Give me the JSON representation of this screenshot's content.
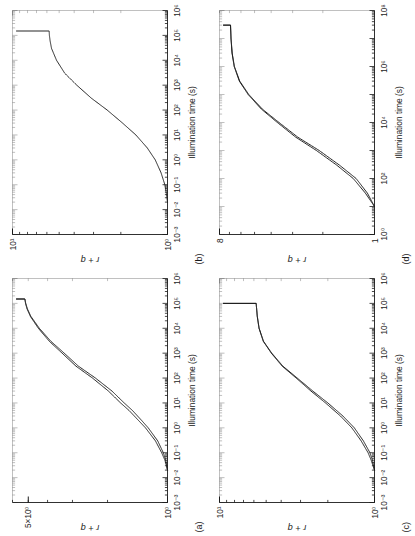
{
  "figure": {
    "orientation": "rotated-90-ccw",
    "background": "#ffffff",
    "line_color": "#1a1a1a",
    "panel_count": 4
  },
  "panels": [
    {
      "tag": "(a)",
      "name": "panel-a",
      "xlabel": "Illumination time (s)",
      "ylabel": "r + q",
      "xticks": [
        "10^-3",
        "10^-2",
        "10^-1",
        "10^0",
        "10^1",
        "10^2",
        "10^3",
        "10^4",
        "10^5",
        "10^6"
      ],
      "yticks": [
        "10^0",
        "5×10^0"
      ]
    },
    {
      "tag": "(b)",
      "name": "panel-b",
      "xlabel": "Illumination time (s)",
      "ylabel": "r + q",
      "xticks": [
        "10^-3",
        "10^-2",
        "10^-1",
        "10^0",
        "10^1",
        "10^2",
        "10^3",
        "10^4",
        "10^5",
        "10^6"
      ],
      "yticks": [
        "10^0",
        "10^1"
      ]
    },
    {
      "tag": "(c)",
      "name": "panel-c",
      "xlabel": "Illumination time (s)",
      "ylabel": "r + q",
      "xticks": [
        "10^-3",
        "10^-2",
        "10^-1",
        "10^0",
        "10^1",
        "10^2",
        "10^3",
        "10^4",
        "10^5",
        "10^6"
      ],
      "yticks": [
        "10^0",
        "10^1"
      ]
    },
    {
      "tag": "(d)",
      "name": "panel-d",
      "xlabel": "Illumination time (s)",
      "ylabel": "r + q",
      "xticks": [
        "10^0",
        "10^2",
        "10^4",
        "10^6",
        "10^8"
      ],
      "yticks": [
        "1",
        "8"
      ]
    }
  ],
  "chart_data": [
    {
      "type": "line",
      "panel": "(a)",
      "title": "",
      "xlabel": "Illumination time (s)",
      "ylabel": "r + q",
      "xscale": "log",
      "yscale": "log",
      "xlim": [
        0.001,
        1000000
      ],
      "ylim": [
        1.0,
        6.0
      ],
      "xtick_labels": [
        "10⁻³",
        "10⁻²",
        "10⁻¹",
        "10⁰",
        "10¹",
        "10²",
        "10³",
        "10⁴",
        "10⁵",
        "10⁶"
      ],
      "xtick_values": [
        0.001,
        0.01,
        0.1,
        1,
        10,
        100,
        1000,
        10000,
        100000,
        1000000
      ],
      "ytick_labels": [
        "10⁰",
        "5×10⁰"
      ],
      "ytick_values": [
        1,
        5
      ],
      "grid": false,
      "legend": false,
      "series": [
        {
          "name": "trace-1",
          "x": [
            0.02,
            0.05,
            0.1,
            0.3,
            1,
            2,
            5,
            10,
            30,
            100,
            300,
            1000,
            3000,
            10000,
            30000,
            60000,
            100000,
            150000
          ],
          "y": [
            1.0,
            1.02,
            1.05,
            1.12,
            1.25,
            1.35,
            1.5,
            1.65,
            1.9,
            2.3,
            2.8,
            3.3,
            3.85,
            4.4,
            4.85,
            5.05,
            5.15,
            5.2
          ]
        },
        {
          "name": "trace-2",
          "x": [
            0.02,
            0.05,
            0.1,
            0.3,
            1,
            2,
            5,
            10,
            30,
            100,
            300,
            1000,
            3000,
            10000,
            30000,
            60000,
            100000,
            150000
          ],
          "y": [
            1.0,
            1.03,
            1.07,
            1.15,
            1.29,
            1.4,
            1.56,
            1.72,
            1.98,
            2.38,
            2.88,
            3.38,
            3.92,
            4.45,
            4.88,
            5.07,
            5.16,
            5.2
          ]
        }
      ]
    },
    {
      "type": "line",
      "panel": "(b)",
      "title": "",
      "xlabel": "Illumination time (s)",
      "ylabel": "r + q",
      "xscale": "log",
      "yscale": "log",
      "xlim": [
        0.001,
        1000000
      ],
      "ylim": [
        1.0,
        10.0
      ],
      "xtick_labels": [
        "10⁻³",
        "10⁻²",
        "10⁻¹",
        "10⁰",
        "10¹",
        "10²",
        "10³",
        "10⁴",
        "10⁵",
        "10⁶"
      ],
      "xtick_values": [
        0.001,
        0.01,
        0.1,
        1,
        10,
        100,
        1000,
        10000,
        100000,
        1000000
      ],
      "ytick_labels": [
        "10⁰",
        "10¹"
      ],
      "ytick_values": [
        1,
        10
      ],
      "grid": false,
      "legend": false,
      "series": [
        {
          "name": "trace-1",
          "x": [
            0.02,
            0.05,
            0.1,
            0.3,
            1,
            3,
            10,
            30,
            100,
            300,
            1000,
            3000,
            10000,
            30000,
            60000,
            100000,
            150000
          ],
          "y": [
            1.0,
            1.02,
            1.04,
            1.1,
            1.2,
            1.35,
            1.6,
            1.95,
            2.45,
            3.1,
            3.85,
            4.6,
            5.2,
            5.6,
            5.72,
            5.78,
            5.8
          ]
        }
      ]
    },
    {
      "type": "line",
      "panel": "(c)",
      "title": "",
      "xlabel": "Illumination time (s)",
      "ylabel": "r + q",
      "xscale": "log",
      "yscale": "log",
      "xlim": [
        0.001,
        1000000
      ],
      "ylim": [
        1.0,
        10.0
      ],
      "xtick_labels": [
        "10⁻³",
        "10⁻²",
        "10⁻¹",
        "10⁰",
        "10¹",
        "10²",
        "10³",
        "10⁴",
        "10⁵",
        "10⁶"
      ],
      "xtick_values": [
        0.001,
        0.01,
        0.1,
        1,
        10,
        100,
        1000,
        10000,
        100000,
        1000000
      ],
      "ytick_labels": [
        "10⁰",
        "10¹"
      ],
      "ytick_values": [
        1,
        10
      ],
      "grid": false,
      "legend": false,
      "series": [
        {
          "name": "trace-1",
          "x": [
            0.02,
            0.05,
            0.1,
            0.3,
            1,
            3,
            10,
            30,
            100,
            300,
            1000,
            3000,
            10000,
            30000,
            60000,
            100000
          ],
          "y": [
            1.0,
            1.03,
            1.07,
            1.18,
            1.35,
            1.6,
            2.0,
            2.5,
            3.15,
            3.9,
            4.6,
            5.2,
            5.55,
            5.7,
            5.76,
            5.8
          ]
        },
        {
          "name": "trace-2",
          "x": [
            0.02,
            0.05,
            0.1,
            0.3,
            1,
            3,
            10,
            30,
            100,
            300,
            1000,
            3000,
            10000,
            30000,
            60000,
            100000
          ],
          "y": [
            1.0,
            1.05,
            1.1,
            1.22,
            1.4,
            1.66,
            2.07,
            2.57,
            3.2,
            3.94,
            4.63,
            5.22,
            5.56,
            5.71,
            5.76,
            5.8
          ]
        }
      ]
    },
    {
      "type": "line",
      "panel": "(d)",
      "title": "",
      "xlabel": "Illumination time (s)",
      "ylabel": "r + q",
      "xscale": "log",
      "yscale": "log",
      "xlim": [
        1,
        100000000
      ],
      "ylim": [
        1,
        8
      ],
      "xtick_labels": [
        "10⁰",
        "10²",
        "10⁴",
        "10⁶",
        "10⁸"
      ],
      "xtick_values": [
        1,
        100,
        10000,
        1000000,
        100000000
      ],
      "ytick_labels": [
        "1",
        "8"
      ],
      "ytick_values": [
        1,
        8
      ],
      "grid": false,
      "legend": false,
      "series": [
        {
          "name": "trace-1",
          "x": [
            10,
            30,
            100,
            300,
            1000,
            3000,
            10000,
            30000,
            100000,
            300000,
            1000000,
            3000000,
            10000000,
            30000000
          ],
          "y": [
            1.0,
            1.1,
            1.28,
            1.6,
            2.1,
            2.8,
            3.6,
            4.5,
            5.4,
            6.1,
            6.55,
            6.75,
            6.85,
            6.9
          ]
        },
        {
          "name": "trace-2",
          "x": [
            10,
            30,
            100,
            300,
            1000,
            3000,
            10000,
            30000,
            100000,
            300000,
            1000000,
            3000000,
            10000000,
            30000000
          ],
          "y": [
            1.0,
            1.13,
            1.33,
            1.66,
            2.18,
            2.88,
            3.68,
            4.56,
            5.45,
            6.13,
            6.57,
            6.76,
            6.86,
            6.9
          ]
        }
      ]
    }
  ]
}
